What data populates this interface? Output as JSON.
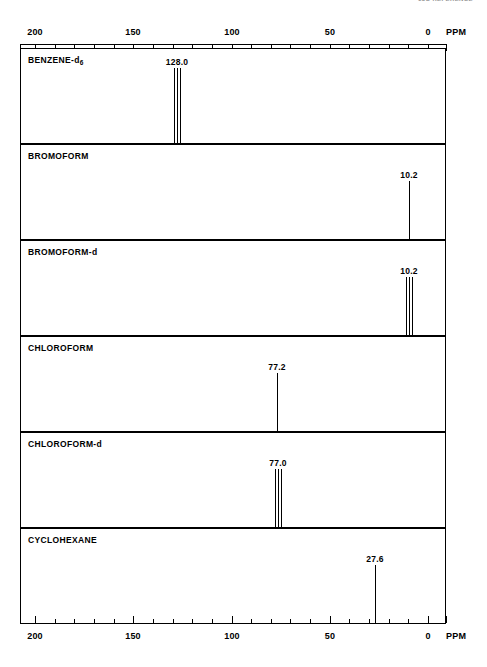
{
  "header": {
    "note": "13C REFERENCE"
  },
  "axis": {
    "unit_label": "PPM",
    "tick_labels": [
      "200",
      "150",
      "100",
      "50",
      "0"
    ],
    "tick_values": [
      200,
      150,
      100,
      50,
      0
    ],
    "minor_step": 10,
    "range_max": 200,
    "range_min": 0
  },
  "panels": [
    {
      "name": "BENZENE-d6",
      "label_main": "BENZENE-d",
      "label_sub": "6",
      "peak_label": "128.0",
      "shift": 128.0,
      "multiplicity": 3,
      "height_pct": 78
    },
    {
      "name": "BROMOFORM",
      "label_main": "BROMOFORM",
      "label_sub": "",
      "peak_label": "10.2",
      "shift": 10.2,
      "multiplicity": 1,
      "height_pct": 60
    },
    {
      "name": "BROMOFORM-d",
      "label_main": "BROMOFORM-d",
      "label_sub": "",
      "peak_label": "10.2",
      "shift": 10.2,
      "multiplicity": 3,
      "height_pct": 60
    },
    {
      "name": "CHLOROFORM",
      "label_main": "CHLOROFORM",
      "label_sub": "",
      "peak_label": "77.2",
      "shift": 77.2,
      "multiplicity": 1,
      "height_pct": 60
    },
    {
      "name": "CHLOROFORM-d",
      "label_main": "CHLOROFORM-d",
      "label_sub": "",
      "peak_label": "77.0",
      "shift": 77.0,
      "multiplicity": 3,
      "height_pct": 60
    },
    {
      "name": "CYCLOHEXANE",
      "label_main": "CYCLOHEXANE",
      "label_sub": "",
      "peak_label": "27.6",
      "shift": 27.6,
      "multiplicity": 1,
      "height_pct": 60
    }
  ],
  "chart_data": {
    "type": "line",
    "xlabel": "PPM",
    "ylabel": "",
    "xlim": [
      200,
      0
    ],
    "x_axis_reversed": true,
    "grid": false,
    "legend": "none",
    "tick_labels": [
      "200",
      "150",
      "100",
      "50",
      "0"
    ],
    "tick_values": [
      200,
      150,
      100,
      50,
      0
    ],
    "minor_tick_step": 10,
    "unit": "PPM",
    "series": [
      {
        "name": "BENZENE-d6",
        "peaks": [
          {
            "shift": 128.0,
            "label": "128.0",
            "lines": 3,
            "splitting": "triplet",
            "relative_height": 0.78
          }
        ]
      },
      {
        "name": "BROMOFORM",
        "peaks": [
          {
            "shift": 10.2,
            "label": "10.2",
            "lines": 1,
            "splitting": "singlet",
            "relative_height": 0.6
          }
        ]
      },
      {
        "name": "BROMOFORM-d",
        "peaks": [
          {
            "shift": 10.2,
            "label": "10.2",
            "lines": 3,
            "splitting": "triplet",
            "relative_height": 0.6
          }
        ]
      },
      {
        "name": "CHLOROFORM",
        "peaks": [
          {
            "shift": 77.2,
            "label": "77.2",
            "lines": 1,
            "splitting": "singlet",
            "relative_height": 0.6
          }
        ]
      },
      {
        "name": "CHLOROFORM-d",
        "peaks": [
          {
            "shift": 77.0,
            "label": "77.0",
            "lines": 3,
            "splitting": "triplet",
            "relative_height": 0.6
          }
        ]
      },
      {
        "name": "CYCLOHEXANE",
        "peaks": [
          {
            "shift": 27.6,
            "label": "27.6",
            "lines": 1,
            "splitting": "singlet",
            "relative_height": 0.6
          }
        ]
      }
    ]
  }
}
